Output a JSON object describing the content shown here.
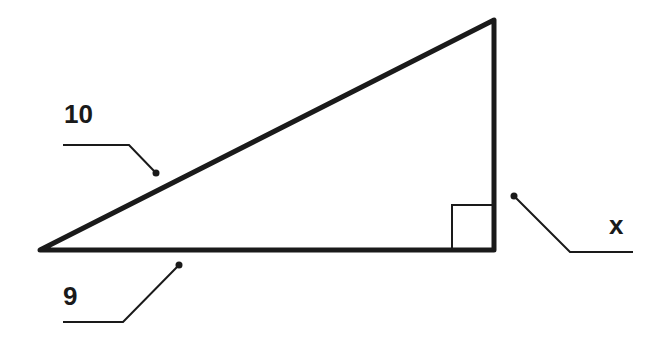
{
  "diagram": {
    "type": "right-triangle",
    "labels": {
      "hypotenuse": "10",
      "base": "9",
      "height": "x"
    },
    "right_angle_marker": true,
    "colors": {
      "stroke": "#1a1a1a",
      "background": "#ffffff"
    }
  }
}
